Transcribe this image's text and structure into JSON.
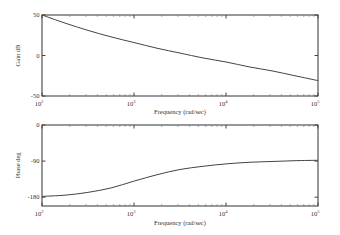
{
  "chart_data": [
    {
      "type": "line",
      "title": "",
      "xlabel": "Frequency (rad/sec)",
      "ylabel": "Gain dB",
      "xscale": "log",
      "xlim": [
        100,
        100000
      ],
      "ylim": [
        -50,
        50
      ],
      "xticks": [
        {
          "base": "10",
          "exp": "2"
        },
        {
          "base": "10",
          "exp": "3"
        },
        {
          "base": "10",
          "exp": "4"
        },
        {
          "base": "10",
          "exp": "5"
        }
      ],
      "xtick_values": [
        100,
        1000,
        10000,
        100000
      ],
      "yticks": [
        "50",
        "0",
        "-50"
      ],
      "ytick_values": [
        50,
        0,
        -50
      ],
      "grid": false,
      "series": [
        {
          "name": "gain",
          "x": [
            100,
            178,
            316,
            562,
            1000,
            1778,
            3162,
            5623,
            10000,
            17783,
            31623,
            56234,
            100000
          ],
          "y": [
            50,
            40,
            31,
            23,
            16,
            9,
            3,
            -3,
            -8,
            -14,
            -19,
            -25,
            -31
          ]
        }
      ]
    },
    {
      "type": "line",
      "title": "",
      "xlabel": "Frequency (rad/sec)",
      "ylabel": "Phase deg",
      "xscale": "log",
      "xlim": [
        100,
        100000
      ],
      "ylim": [
        -202,
        0
      ],
      "xticks": [
        {
          "base": "10",
          "exp": "2"
        },
        {
          "base": "10",
          "exp": "3"
        },
        {
          "base": "10",
          "exp": "4"
        },
        {
          "base": "10",
          "exp": "5"
        }
      ],
      "xtick_values": [
        100,
        1000,
        10000,
        100000
      ],
      "yticks": [
        "0",
        "-90",
        "-180"
      ],
      "ytick_values": [
        0,
        -90,
        -180
      ],
      "grid": false,
      "series": [
        {
          "name": "phase",
          "x": [
            100,
            178,
            316,
            562,
            1000,
            1778,
            3162,
            5623,
            10000,
            17783,
            31623,
            56234,
            100000
          ],
          "y": [
            -178,
            -175,
            -168,
            -157,
            -140,
            -124,
            -111,
            -103,
            -97,
            -93,
            -91,
            -89,
            -88
          ]
        }
      ]
    }
  ]
}
